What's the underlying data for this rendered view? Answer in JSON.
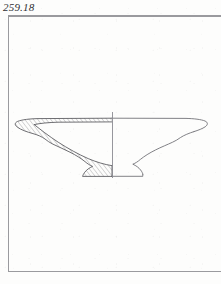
{
  "page": {
    "width": 221,
    "height": 284,
    "background_color": "#fdfdfc"
  },
  "catalog_label": {
    "text": "259.18",
    "color": "#2f2f33",
    "style": "italic-serif"
  },
  "frame": {
    "name": "plate-border-frame",
    "color": "#9a9a9e",
    "stroke_width": 1.1,
    "left": 8,
    "top": 16,
    "right": 226,
    "bottom": 272
  },
  "drawing": {
    "type": "archaeological-pottery-profile",
    "description": "Shallow bowl / plate profile drawing: left half shown as hatched cross-section, right half as exterior outline, separated by a vertical central axis.",
    "line_color": "#55555a",
    "hatch_color": "#6e6e73",
    "axis_color": "#8c8c92",
    "rim_y": 118,
    "foot_bottom_y": 176,
    "axis_x": 112,
    "axis_top_y": 112,
    "axis_bottom_y": 177,
    "left_rim_tip_x": 15,
    "right_rim_tip_x": 208,
    "foot_left_x": 76,
    "foot_right_x": 150,
    "section_side": "left",
    "outline_side": "right",
    "hatch_direction": "lower-left-to-upper-right",
    "hatch_spacing_px": 2.4
  }
}
